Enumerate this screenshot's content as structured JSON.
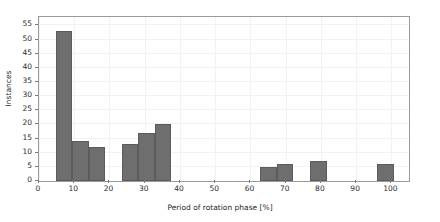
{
  "chart_data": {
    "type": "bar",
    "title": "",
    "subtitle": "",
    "xlabel": "Period of rotation phase [%]",
    "ylabel": "Instances",
    "xlim": [
      0,
      105
    ],
    "ylim": [
      0,
      58
    ],
    "xticks": [
      0,
      10,
      20,
      30,
      40,
      50,
      60,
      70,
      80,
      90,
      100
    ],
    "yticks": [
      0,
      5,
      10,
      15,
      20,
      25,
      30,
      35,
      40,
      45,
      50,
      55
    ],
    "grid": true,
    "legend": null,
    "bar_color": "#6e6e6e",
    "bar_edge_color": "#5c5c5c",
    "background_color": "#ffffff",
    "grid_color": "#f2f2f2",
    "axes_color": "#9a9a9a",
    "bin_width": 4.7,
    "categories": [
      4.7,
      9.4,
      14.1,
      23.5,
      28.2,
      32.9,
      62.8,
      67.5,
      77.0,
      96.0
    ],
    "values": [
      53,
      14,
      12,
      13,
      17,
      20,
      5,
      6,
      7,
      6
    ],
    "bars": [
      {
        "x0": 4.7,
        "x1": 9.4,
        "value": 53
      },
      {
        "x0": 9.4,
        "x1": 14.1,
        "value": 14
      },
      {
        "x0": 14.1,
        "x1": 18.8,
        "value": 12
      },
      {
        "x0": 23.5,
        "x1": 28.2,
        "value": 13
      },
      {
        "x0": 28.2,
        "x1": 32.9,
        "value": 17
      },
      {
        "x0": 32.9,
        "x1": 37.6,
        "value": 20
      },
      {
        "x0": 62.8,
        "x1": 67.5,
        "value": 5
      },
      {
        "x0": 67.5,
        "x1": 72.2,
        "value": 6
      },
      {
        "x0": 77.0,
        "x1": 81.7,
        "value": 7
      },
      {
        "x0": 96.0,
        "x1": 100.7,
        "value": 6
      }
    ]
  }
}
